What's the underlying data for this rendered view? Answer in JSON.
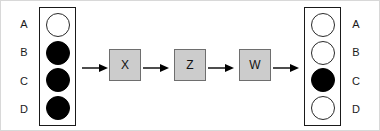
{
  "diagram": {
    "type": "state-transition-pipeline",
    "registers": [
      {
        "id": "input",
        "name": "input-register",
        "label_position": "left",
        "rows": [
          {
            "label": "A",
            "state": "empty"
          },
          {
            "label": "B",
            "state": "filled"
          },
          {
            "label": "C",
            "state": "filled"
          },
          {
            "label": "D",
            "state": "filled"
          }
        ]
      },
      {
        "id": "output",
        "name": "output-register",
        "label_position": "right",
        "rows": [
          {
            "label": "A",
            "state": "empty"
          },
          {
            "label": "B",
            "state": "empty"
          },
          {
            "label": "C",
            "state": "filled"
          },
          {
            "label": "D",
            "state": "empty"
          }
        ]
      }
    ],
    "operations": [
      {
        "label": "X"
      },
      {
        "label": "Z"
      },
      {
        "label": "W"
      }
    ],
    "arrow_count": 4,
    "colors": {
      "filled_cell": "#000000",
      "empty_cell": "#ffffff",
      "cell_outline": "#2a2a2a",
      "op_box_fill": "#cccccc",
      "op_box_border": "#6e6e6e",
      "register_border": "#1a1a1a",
      "arrow": "#000000",
      "background": "#ffffff"
    }
  }
}
